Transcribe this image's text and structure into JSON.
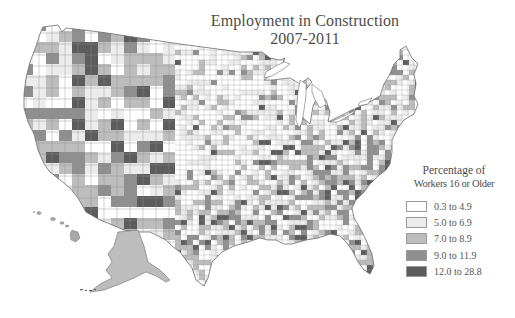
{
  "map": {
    "title_line1": "Employment in Construction",
    "title_line2": "2007-2011",
    "region": "United States (counties), including Alaska and Hawaii insets",
    "colors": {
      "background": "#ffffff",
      "border": "#7a7a7a",
      "water": "#ffffff"
    }
  },
  "legend": {
    "title_line1": "Percentage of",
    "title_line2": "Workers 16 or Older",
    "items": [
      {
        "label": "0.3 to 4.9",
        "color": "#ffffff"
      },
      {
        "label": "5.0 to 6.9",
        "color": "#ececec"
      },
      {
        "label": "7.0 to 8.9",
        "color": "#bdbdbd"
      },
      {
        "label": "9.0 to 11.9",
        "color": "#8f8f8f"
      },
      {
        "label": "12.0 to 28.8",
        "color": "#5c5c5c"
      }
    ]
  },
  "chart_data": {
    "type": "choropleth",
    "title": "Employment in Construction 2007-2011",
    "legend_title": "Percentage of Workers 16 or Older",
    "classes": [
      {
        "range": [
          0.3,
          4.9
        ],
        "label": "0.3 to 4.9",
        "color": "#ffffff"
      },
      {
        "range": [
          5.0,
          6.9
        ],
        "label": "5.0 to 6.9",
        "color": "#ececec"
      },
      {
        "range": [
          7.0,
          8.9
        ],
        "label": "7.0 to 8.9",
        "color": "#bdbdbd"
      },
      {
        "range": [
          9.0,
          11.9
        ],
        "label": "9.0 to 11.9",
        "color": "#8f8f8f"
      },
      {
        "range": [
          12.0,
          28.8
        ],
        "label": "12.0 to 28.8",
        "color": "#5c5c5c"
      }
    ],
    "legend_position": "right",
    "unit": "county"
  }
}
